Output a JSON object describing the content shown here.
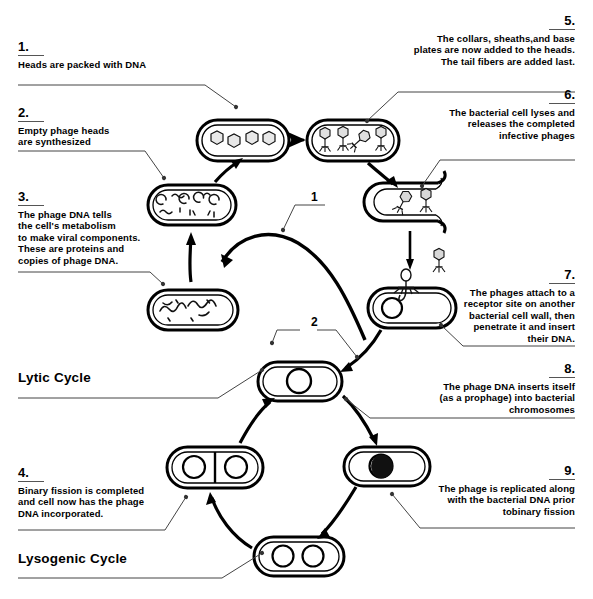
{
  "diagram": {
    "type": "cycle-diagram",
    "cycle_labels": [
      {
        "id": "lytic",
        "text": "Lytic Cycle"
      },
      {
        "id": "lysogenic",
        "text": "Lysogenic Cycle"
      }
    ],
    "arc_labels": [
      {
        "id": "arc-1",
        "text": "1"
      },
      {
        "id": "arc-2",
        "text": "2"
      }
    ],
    "stages": [
      {
        "id": "stage-empty-heads",
        "描述": "bacterium with 4 empty phage heads",
        "items": 4
      },
      {
        "id": "stage-assembled-phages",
        "描述": "bacterium with 4 assembled phages",
        "items": 4
      },
      {
        "id": "stage-viral-components",
        "描述": "bacterium with phage parts and DNA",
        "items": 4
      },
      {
        "id": "stage-phage-dna",
        "描述": "bacterium with replicating phage DNA strands",
        "items": 1
      },
      {
        "id": "stage-lysed-cell",
        "描述": "lysed bacterium releasing phages",
        "items": 2
      },
      {
        "id": "stage-attachment",
        "描述": "phage attached to bacterial cell wall injecting DNA",
        "items": 1
      },
      {
        "id": "stage-host-cell",
        "描述": "bacterium with chromosome",
        "items": 1
      },
      {
        "id": "stage-prophage",
        "描述": "bacterium with prophage integrated into chromosome",
        "items": 1
      },
      {
        "id": "stage-replicated",
        "描述": "bacterium with replicated prophage DNA",
        "items": 1
      },
      {
        "id": "stage-binary-fission",
        "描述": "bacterium dividing by binary fission",
        "items": 2
      }
    ]
  },
  "callouts": {
    "c1": {
      "number": "1.",
      "text": "Heads are packed with DNA"
    },
    "c2": {
      "number": "2.",
      "text": "Empty phage heads\nare synthesized"
    },
    "c3": {
      "number": "3.",
      "text": "The phage DNA tells\nthe cell's metabolism\nto make viral components.\nThese are proteins and\ncopies of phage DNA."
    },
    "c4": {
      "number": "4.",
      "text": "Binary fission is completed\nand cell now has the phage\nDNA incorporated."
    },
    "c5": {
      "number": "5.",
      "text": "The collars, sheaths,and base\nplates are now added to the heads.\nThe tail fibers are added last."
    },
    "c6": {
      "number": "6.",
      "text": "The bacterial cell lyses and\nreleases the completed\ninfective phages"
    },
    "c7": {
      "number": "7.",
      "text": "The phages attach to a\nreceptor site on another\nbacterial cell wall, then\npenetrate it and insert\ntheir DNA."
    },
    "c8": {
      "number": "8.",
      "text": "The phage DNA inserts itself\n(as a prophage) into bacterial\nchromosomes"
    },
    "c9": {
      "number": "9.",
      "text": "The phage is replicated along\nwith the bacterial DNA prior\ntobinary fission"
    }
  },
  "colors": {
    "ink": "#000000",
    "rule": "#555555",
    "background": "#ffffff",
    "leader": "#444444"
  }
}
